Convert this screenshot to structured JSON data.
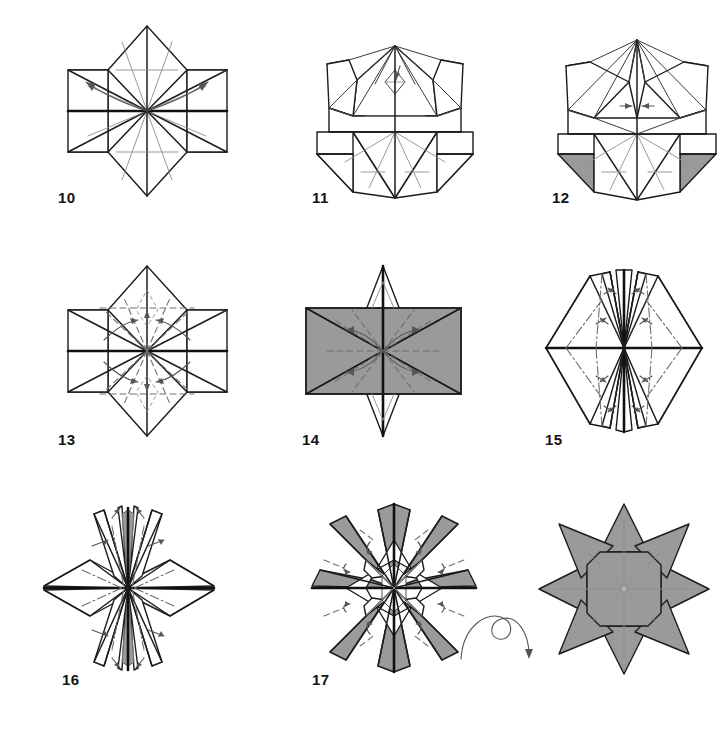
{
  "page": {
    "background_color": "#ffffff",
    "width": 725,
    "height": 735,
    "line_color": "#1c1c1c",
    "shade_color": "#9a9a9a",
    "crease_color": "#8d8d8d",
    "arrow_color": "#55555a"
  },
  "figures": [
    {
      "id": "step-10",
      "label": "10",
      "label_x": 58,
      "label_y": 190,
      "x": 60,
      "y": 22,
      "width": 175,
      "height": 175,
      "kind": "blintzed-kite-base",
      "description": "Vertically elongated diamond with four shaded triangular flaps at left and right, horizontal center band, radial creases; two curved arrows sweeping from the center outward to upper-left and upper-right corners."
    },
    {
      "id": "step-11",
      "label": "11",
      "label_x": 312,
      "label_y": 190,
      "x": 305,
      "y": 22,
      "width": 175,
      "height": 180,
      "kind": "partially-folded-top",
      "description": "Same base with the upper half collapsed into narrow pleats, small shaded horns at upper left and right, shaded flaps at lower left and right; small arrow near apex."
    },
    {
      "id": "step-12",
      "label": "12",
      "label_x": 552,
      "label_y": 190,
      "x": 548,
      "y": 22,
      "width": 175,
      "height": 180,
      "kind": "narrowed-top",
      "description": "Top section pinched into a narrow spire, shaded horns at upper left and right, shaded flaps lower left and right; two short converging arrows at center."
    },
    {
      "id": "step-13",
      "label": "13",
      "label_x": 58,
      "label_y": 432,
      "x": 60,
      "y": 262,
      "width": 175,
      "height": 175,
      "kind": "eight-point-prefold",
      "description": "Diamond with four shaded corner triangles and a heavy horizontal center band; dashed valley folds radiating from the center with small curved arrows rotating flaps toward the vertical axis."
    },
    {
      "id": "step-14",
      "label": "14",
      "label_x": 302,
      "label_y": 432,
      "x": 296,
      "y": 262,
      "width": 175,
      "height": 175,
      "kind": "hourglass-shaded",
      "description": "Two large shaded triangles forming an hourglass/bowtie silhouette with white spikes above and below; dashed radial valley folds and four curved arrows from center toward the left and right points."
    },
    {
      "id": "step-15",
      "label": "15",
      "label_x": 545,
      "label_y": 432,
      "x": 530,
      "y": 262,
      "width": 185,
      "height": 180,
      "kind": "four-point-pleated",
      "description": "White four-pointed form with long left and right points and narrow pleated spikes top and bottom; dashed mountain creases and eight small paired arrows marking reverse folds."
    },
    {
      "id": "step-16",
      "label": "16",
      "label_x": 62,
      "label_y": 672,
      "x": 30,
      "y": 500,
      "width": 195,
      "height": 175,
      "kind": "pleated-four-point",
      "description": "Slim four-pointed star with multiple narrow pleats top and bottom and a small gray sliver along the vertical axis; dashed mountain folds and several small curved arrows."
    },
    {
      "id": "step-17",
      "label": "17",
      "label_x": 312,
      "label_y": 672,
      "x": 300,
      "y": 498,
      "width": 185,
      "height": 180,
      "kind": "eight-point-open",
      "description": "Eight-pointed star with alternating gray and white facets and an open white center ring; eight small dashed lines with curved arrows around the perimeter indicate the final tucks."
    },
    {
      "id": "step-18",
      "label": "",
      "label_x": 0,
      "label_y": 0,
      "x": 535,
      "y": 500,
      "width": 175,
      "height": 175,
      "kind": "finished-star",
      "description": "Finished eight-pointed gray star with an octagonal centre panel and faint radial creases — the completed model shown after turning over."
    }
  ],
  "symbols": [
    {
      "id": "turn-over",
      "name": "turn-over-arrow",
      "x": 455,
      "y": 605,
      "width": 80,
      "height": 60,
      "meaning": "Turn the model over"
    }
  ]
}
